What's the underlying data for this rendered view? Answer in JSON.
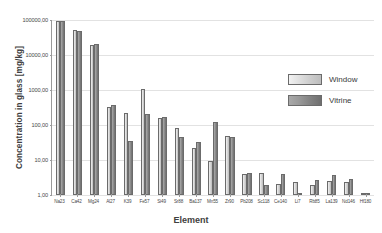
{
  "chart_data": {
    "type": "bar",
    "title": "",
    "xlabel": "Element",
    "ylabel": "Concentration in glass [mg/kg]",
    "yscale": "log",
    "ylim": [
      1,
      100000
    ],
    "ytick_labels": [
      "100000,00",
      "10000,00",
      "1000,00",
      "100,00",
      "10,00",
      "1,00"
    ],
    "ytick_values": [
      100000,
      10000,
      1000,
      100,
      10,
      1
    ],
    "grid": true,
    "legend_position": "inside-right",
    "categories": [
      "Na23",
      "Ca42",
      "Mg24",
      "Al27",
      "K39",
      "Fe57",
      "Si49",
      "Sr88",
      "Ba137",
      "Mn55",
      "Zr90",
      "Pb208",
      "Sc118",
      "Ce140",
      "Li7",
      "Rb85",
      "La139",
      "Nd146",
      "Hf180"
    ],
    "series": [
      {
        "name": "Window",
        "values": [
          95000,
          52000,
          19000,
          330,
          220,
          1100,
          155,
          80,
          22,
          9.5,
          50,
          4.0,
          4.2,
          2.1,
          2.4,
          1.9,
          2.5,
          2.4,
          1.05
        ]
      },
      {
        "name": "Vitrine",
        "values": [
          92000,
          48000,
          20000,
          380,
          36,
          205,
          165,
          46,
          33,
          125,
          44,
          4.3,
          1.9,
          4.1,
          1.15,
          2.6,
          3.8,
          2.8,
          1.15
        ]
      }
    ]
  },
  "legend": {
    "items": [
      {
        "label": "Window"
      },
      {
        "label": "Vitrine"
      }
    ]
  },
  "colors": {
    "window_fill": "#d8d8d8",
    "vitrine_fill": "#8a8a8a",
    "bar_stroke": "#6b6b6b",
    "grid": "#e2e2e2",
    "axis": "#9a9a9a",
    "text": "#3a3a3a"
  }
}
